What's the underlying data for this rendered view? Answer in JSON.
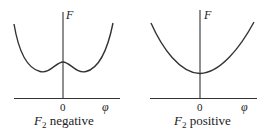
{
  "panels": [
    {
      "id": "negative",
      "y_axis_label": "F",
      "x_axis_label": "φ",
      "origin_label": "0",
      "caption_main": "F",
      "caption_sub": "2",
      "caption_rest": " negative",
      "curve_description": "double-well (Mexican-hat) potential with local maximum at φ=0 and two symmetric minima"
    },
    {
      "id": "positive",
      "y_axis_label": "F",
      "x_axis_label": "φ",
      "origin_label": "0",
      "caption_main": "F",
      "caption_sub": "2",
      "caption_rest": " positive",
      "curve_description": "single-well parabola with minimum at φ=0"
    }
  ],
  "colors": {
    "line": "#333333",
    "text": "#222222",
    "background": "#ffffff"
  }
}
